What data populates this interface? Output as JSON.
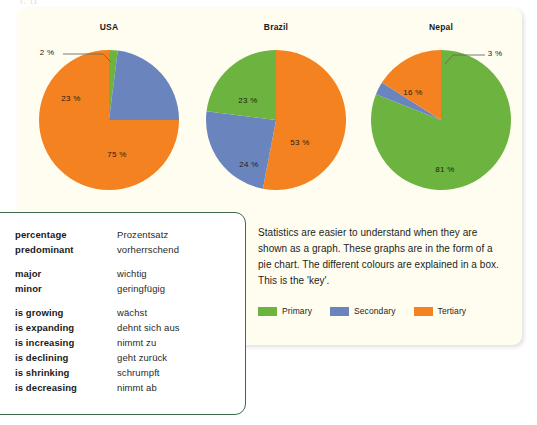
{
  "page": {
    "cut_off_header": "c  g",
    "background": "#ffffff",
    "panel_background": "#fefdef"
  },
  "colors": {
    "primary": "#6cb33f",
    "secondary": "#6a85bd",
    "tertiary": "#f58220",
    "vocab_border": "#3f6a4e",
    "text": "#1d1d1d"
  },
  "chart_data": [
    {
      "type": "pie",
      "title": "USA",
      "categories": [
        "Primary",
        "Secondary",
        "Tertiary"
      ],
      "values": [
        2,
        23,
        75
      ],
      "labels": [
        "2 %",
        "23 %",
        "75 %"
      ],
      "colors": [
        "#6cb33f",
        "#6a85bd",
        "#f58220"
      ],
      "start_angle": 0,
      "direction": "clockwise",
      "legend": "shared",
      "label_positions": [
        {
          "label": "2 %",
          "x": 22,
          "y": 16,
          "leader": true
        },
        {
          "label": "23 %",
          "x": 46,
          "y": 62,
          "leader": false
        },
        {
          "label": "75 %",
          "x": 92,
          "y": 118,
          "leader": false
        }
      ]
    },
    {
      "type": "pie",
      "title": "Brazil",
      "categories": [
        "Tertiary",
        "Secondary",
        "Primary"
      ],
      "values": [
        53,
        24,
        23
      ],
      "labels": [
        "53 %",
        "24 %",
        "23 %"
      ],
      "colors": [
        "#f58220",
        "#6a85bd",
        "#6cb33f"
      ],
      "start_angle": 0,
      "direction": "clockwise",
      "legend": "shared",
      "label_positions": [
        {
          "label": "53 %",
          "x": 108,
          "y": 106,
          "leader": false
        },
        {
          "label": "24 %",
          "x": 57,
          "y": 128,
          "leader": false
        },
        {
          "label": "23 %",
          "x": 56,
          "y": 64,
          "leader": false
        }
      ]
    },
    {
      "type": "pie",
      "title": "Nepal",
      "categories": [
        "Primary",
        "Secondary",
        "Tertiary"
      ],
      "values": [
        81,
        3,
        16
      ],
      "labels": [
        "81 %",
        "3 %",
        "16 %"
      ],
      "colors": [
        "#6cb33f",
        "#6a85bd",
        "#f58220"
      ],
      "start_angle": 0,
      "direction": "clockwise",
      "legend": "shared",
      "label_positions": [
        {
          "label": "81 %",
          "x": 88,
          "y": 133,
          "leader": false
        },
        {
          "label": "3 %",
          "x": 138,
          "y": 17,
          "leader": true
        },
        {
          "label": "16 %",
          "x": 56,
          "y": 56,
          "leader": false
        }
      ]
    }
  ],
  "vocabulary": {
    "groups": [
      [
        {
          "en": "percentage",
          "de": "Prozentsatz"
        },
        {
          "en": "predominant",
          "de": "vorherrschend"
        }
      ],
      [
        {
          "en": "major",
          "de": "wichtig"
        },
        {
          "en": "minor",
          "de": "geringfügig"
        }
      ],
      [
        {
          "en": "is growing",
          "de": "wächst"
        },
        {
          "en": "is expanding",
          "de": "dehnt sich aus"
        },
        {
          "en": "is increasing",
          "de": "nimmt zu"
        },
        {
          "en": "is declining",
          "de": "geht zurück"
        },
        {
          "en": "is shrinking",
          "de": "schrumpft"
        },
        {
          "en": "is decreasing",
          "de": "nimmt ab"
        }
      ]
    ]
  },
  "explanation": {
    "text": "Statistics are easier to understand when they are shown as a graph. These graphs are in the form of a pie chart. The different colours are explained in a box. This is the 'key'.",
    "legend": [
      {
        "label": "Primary",
        "color": "#6cb33f"
      },
      {
        "label": "Secondary",
        "color": "#6a85bd"
      },
      {
        "label": "Tertiary",
        "color": "#f58220"
      }
    ]
  }
}
